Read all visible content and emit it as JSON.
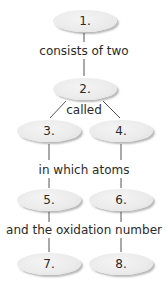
{
  "nodes": [
    "1.",
    "2.",
    "3.",
    "4.",
    "5.",
    "6.",
    "7.",
    "8."
  ],
  "links": {
    "l1": "consists of two",
    "l2": "called",
    "l3": "in which atoms",
    "l4": "and the oxidation number"
  },
  "colors": {
    "node_fill": "#ebebeb",
    "line": "#555555",
    "text": "#2a2a2a"
  }
}
